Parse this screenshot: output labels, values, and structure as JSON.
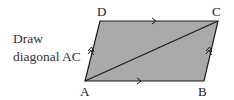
{
  "instruction": {
    "line1": "Draw",
    "line2": "diagonal AC"
  },
  "shape": {
    "type": "parallelogram",
    "fill": "#a9a9a9",
    "stroke": "#1a1a1a",
    "vertices": {
      "A": {
        "label": "A",
        "x": 85,
        "y": 81
      },
      "B": {
        "label": "B",
        "x": 204,
        "y": 81
      },
      "C": {
        "label": "C",
        "x": 218,
        "y": 21
      },
      "D": {
        "label": "D",
        "x": 100,
        "y": 21
      }
    },
    "diagonal": {
      "from": "A",
      "to": "C"
    },
    "parallel_marks": {
      "DC_AB": "single-arrow",
      "AD_BC": "double-arrow"
    }
  }
}
